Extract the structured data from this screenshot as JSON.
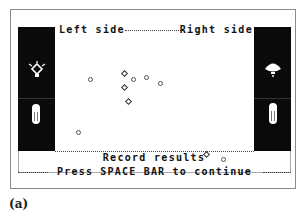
{
  "header": {
    "left_label": "Left side",
    "right_label": "Right side"
  },
  "footer": {
    "record_label": "Record results",
    "prompt": "Press SPACE BAR to continue"
  },
  "caption": "(a)",
  "left_panel": {
    "icons": [
      "light-bulb-radiating-icon",
      "test-tube-icon"
    ]
  },
  "right_panel": {
    "icons": [
      "shell-lamp-icon",
      "test-tube-icon"
    ]
  },
  "colors": {
    "panel": "#0a0a0a",
    "background": "#ffffff",
    "border": "#8a8a8a",
    "text": "#111111"
  },
  "markers": [
    {
      "shape": "dot",
      "x": 33,
      "y": 40
    },
    {
      "shape": "diamond",
      "x": 67,
      "y": 34
    },
    {
      "shape": "dot",
      "x": 76,
      "y": 40
    },
    {
      "shape": "dot",
      "x": 89,
      "y": 38
    },
    {
      "shape": "dot",
      "x": 103,
      "y": 44
    },
    {
      "shape": "diamond",
      "x": 67,
      "y": 48
    },
    {
      "shape": "diamond",
      "x": 71,
      "y": 62
    },
    {
      "shape": "dot",
      "x": 21,
      "y": 93
    },
    {
      "shape": "diamond",
      "x": 149,
      "y": 115
    },
    {
      "shape": "dot",
      "x": 166,
      "y": 120
    }
  ]
}
